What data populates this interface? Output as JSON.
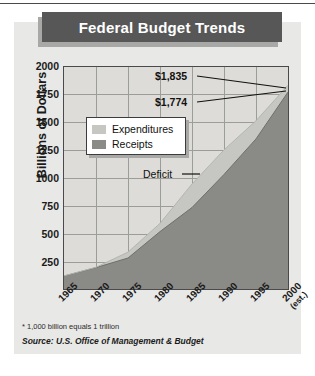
{
  "chart_data": {
    "type": "area",
    "title": "Federal Budget Trends",
    "xlabel": "",
    "ylabel": "Billions of Dollars",
    "x": [
      1965,
      1970,
      1975,
      1980,
      1985,
      1990,
      1995,
      2000
    ],
    "xtick_labels": [
      "1965",
      "1970",
      "1975",
      "1980",
      "1985",
      "1990",
      "1995",
      "2000"
    ],
    "xtick_sublabels": [
      "",
      "",
      "",
      "",
      "",
      "",
      "",
      "(est.)"
    ],
    "ylim": [
      0,
      2000
    ],
    "ytick_labels": [
      "2000",
      "1750",
      "1500",
      "1250",
      "1000",
      "750",
      "500",
      "250"
    ],
    "ytick_values": [
      2000,
      1750,
      1500,
      1250,
      1000,
      750,
      500,
      250
    ],
    "grid": true,
    "legend_position": "upper-left-inside",
    "series": [
      {
        "name": "Expenditures",
        "color": "#c6c6c2",
        "values": [
          118,
          196,
          332,
          591,
          946,
          1253,
          1516,
          1835
        ]
      },
      {
        "name": "Receipts",
        "color": "#8a8a86",
        "values": [
          117,
          193,
          279,
          517,
          734,
          1032,
          1352,
          1774
        ]
      }
    ],
    "annotations": [
      {
        "text": "$1,835",
        "series": "Expenditures",
        "year": 2000,
        "value": 1835
      },
      {
        "text": "$1,774",
        "series": "Receipts",
        "year": 2000,
        "value": 1774
      },
      {
        "text": "Deficit",
        "target": "gap-between-series"
      }
    ],
    "band_label": "Deficit",
    "band_color": "#8a8a86"
  },
  "header": {
    "title": "Federal Budget Trends"
  },
  "axes": {
    "y_title": "Billions of Dollars",
    "y_ticks": [
      "2000",
      "1750",
      "1500",
      "1250",
      "1000",
      "750",
      "500",
      "250"
    ],
    "x_ticks": [
      {
        "label": "1965",
        "sub": ""
      },
      {
        "label": "1970",
        "sub": ""
      },
      {
        "label": "1975",
        "sub": ""
      },
      {
        "label": "1980",
        "sub": ""
      },
      {
        "label": "1985",
        "sub": ""
      },
      {
        "label": "1990",
        "sub": ""
      },
      {
        "label": "1995",
        "sub": ""
      },
      {
        "label": "2000",
        "sub": "(est.)"
      }
    ]
  },
  "legend": {
    "items": [
      {
        "label": "Expenditures",
        "color": "#c6c6c2"
      },
      {
        "label": "Receipts",
        "color": "#8a8a86"
      }
    ]
  },
  "callouts": {
    "expenditures_value": "$1,835",
    "receipts_value": "$1,774",
    "deficit_label": "Deficit"
  },
  "notes": {
    "footnote": "* 1,000 billion equals 1 trillion",
    "source": "Source: U.S. Office of Management & Budget"
  },
  "colors": {
    "banner": "#575757",
    "panel": "#e8e8e6",
    "plot_bg": "#dddcd8",
    "grid": "#9c9c98",
    "expenditures": "#c6c6c2",
    "receipts": "#8a8a86",
    "frame": "#4a4a4a"
  }
}
